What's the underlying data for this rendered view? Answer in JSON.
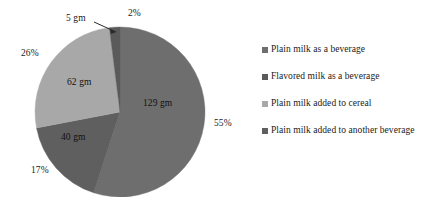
{
  "chart_data": {
    "type": "pie",
    "title": "",
    "subtitle": "",
    "xlabel": "",
    "ylabel": "",
    "legend_position": "right",
    "grid": false,
    "units": "gm",
    "categories": [
      "Plain milk as a beverage",
      "Flavored milk as a beverage",
      "Plain milk added to cereal",
      "Plain milk added to another beverage"
    ],
    "values": [
      129,
      5,
      62,
      40
    ],
    "percentages": [
      55,
      2,
      26,
      17
    ],
    "value_labels": [
      "129 gm",
      "5 gm",
      "62 gm",
      "40 gm"
    ],
    "percent_labels": [
      "55%",
      "2%",
      "26%",
      "17%"
    ],
    "colors": [
      "#6e6e6e",
      "#5a5a5a",
      "#a8a8a8",
      "#5f5f5f"
    ],
    "slices": [
      {
        "name": "Plain milk as a beverage",
        "value": 129,
        "value_label": "129 gm",
        "percent": 55,
        "percent_label": "55%",
        "color": "#6e6e6e",
        "start_angle": 0,
        "end_angle": 198
      },
      {
        "name": "Plain milk added to another beverage",
        "value": 40,
        "value_label": "40 gm",
        "percent": 17,
        "percent_label": "17%",
        "color": "#5f5f5f",
        "start_angle": 198,
        "end_angle": 259.2
      },
      {
        "name": "Plain milk added to cereal",
        "value": 62,
        "value_label": "62 gm",
        "percent": 26,
        "percent_label": "26%",
        "color": "#a8a8a8",
        "start_angle": 259.2,
        "end_angle": 352.8
      },
      {
        "name": "Flavored milk as a beverage",
        "value": 5,
        "value_label": "5 gm",
        "percent": 2,
        "percent_label": "2%",
        "color": "#5a5a5a",
        "start_angle": 352.8,
        "end_angle": 360
      }
    ]
  },
  "pie": {
    "center_x": 120,
    "center_y": 112,
    "radius": 85,
    "labels": {
      "pct_55": "55%",
      "pct_17": "17%",
      "pct_26": "26%",
      "pct_2": "2%",
      "gm_129": "129 gm",
      "gm_40": "40 gm",
      "gm_62": "62 gm",
      "gm_5": "5 gm"
    },
    "callout": {
      "label": "5 gm",
      "target_percent_label": "2%"
    }
  },
  "legend": {
    "items": [
      {
        "label": "Plain milk as a beverage",
        "color": "#6e6e6e"
      },
      {
        "label": "Flavored milk as a beverage",
        "color": "#5a5a5a"
      },
      {
        "label": "Plain milk added to cereal",
        "color": "#a8a8a8"
      },
      {
        "label": "Plain milk added to another beverage",
        "color": "#5f5f5f"
      }
    ]
  }
}
